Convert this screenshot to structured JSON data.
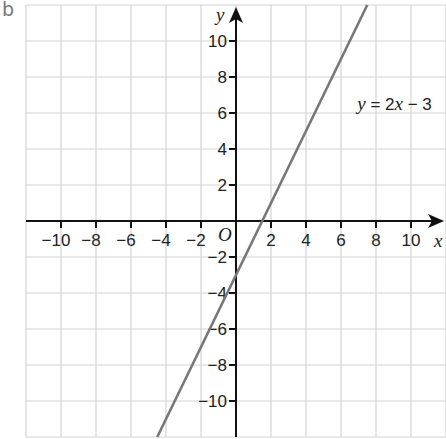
{
  "panel_label": "b",
  "chart_data": {
    "type": "line",
    "title": "",
    "xlabel": "x",
    "ylabel": "y",
    "origin_label": "O",
    "xlim": [
      -12,
      12
    ],
    "ylim": [
      -12,
      12
    ],
    "grid": true,
    "x_ticks": [
      -10,
      -8,
      -6,
      -4,
      -2,
      2,
      4,
      6,
      8,
      10
    ],
    "y_ticks": [
      10,
      8,
      6,
      4,
      2,
      -2,
      -4,
      -6,
      -8,
      -10
    ],
    "series": [
      {
        "name": "y = 2x − 3",
        "equation": "y = 2x - 3",
        "slope": 2,
        "intercept": -3,
        "x": [
          -4.5,
          7.5
        ],
        "y": [
          -12,
          12
        ],
        "color": "#777777"
      }
    ],
    "annotations": [
      {
        "text": "y = 2x − 3",
        "x": 7.5,
        "y": 6.5
      }
    ]
  },
  "colors": {
    "grid": "#d4d4d4",
    "axis": "#111111",
    "line": "#777777",
    "label": "#777777"
  }
}
